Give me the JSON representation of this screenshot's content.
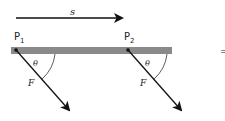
{
  "diagram": {
    "displacement_label": "s",
    "points": [
      {
        "label": "P",
        "sub": "1"
      },
      {
        "label": "P",
        "sub": "2"
      }
    ],
    "angle_label": "θ",
    "force_label": "F",
    "trailing_symbol": "=",
    "colors": {
      "bar": "#8a8a8a",
      "arrow": "#111111"
    }
  }
}
